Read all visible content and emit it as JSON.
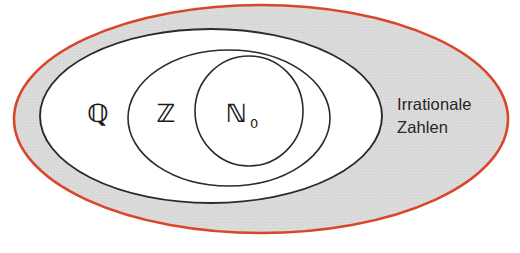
{
  "figure": {
    "background_color": "#ffffff"
  },
  "outer_region": {
    "name": "irrational-numbers-region",
    "label_line1": "Irrationale",
    "label_line2": "Zahlen",
    "stroke_color": "#d9472b",
    "fill_color": "#d9d9d9",
    "stroke_width": "2.6"
  },
  "sets": [
    {
      "id": "rational",
      "symbol": "ℚ",
      "subscript": "",
      "label_x": 98,
      "label_y": 122,
      "font_size": 25,
      "ellipse": {
        "cx": 211,
        "cy": 116,
        "rx": 171,
        "ry": 87
      },
      "stroke_color": "#2b2b2b",
      "fill_color": "#ffffff"
    },
    {
      "id": "integer",
      "symbol": "ℤ",
      "subscript": "",
      "label_x": 166,
      "label_y": 122,
      "font_size": 25,
      "ellipse": {
        "cx": 229,
        "cy": 118,
        "rx": 101,
        "ry": 68
      },
      "stroke_color": "#2b2b2b",
      "fill_color": "#ffffff"
    },
    {
      "id": "natural-with-zero",
      "symbol": "ℕ",
      "subscript": "0",
      "label_x": 236,
      "label_y": 122,
      "font_size": 25,
      "ellipse": {
        "cx": 249,
        "cy": 111,
        "rx": 54,
        "ry": 55
      },
      "stroke_color": "#2b2b2b",
      "fill_color": "#ffffff"
    }
  ],
  "outer_ellipse": {
    "cx": 261,
    "cy": 119,
    "rx": 247,
    "ry": 114
  },
  "outside_text": {
    "x": 397,
    "y_line1": 110,
    "y_line2": 133
  }
}
